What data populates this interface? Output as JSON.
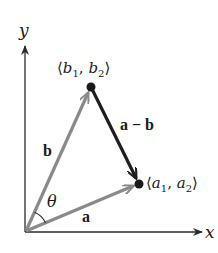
{
  "axes": {
    "x_label": "x",
    "y_label": "y"
  },
  "points": {
    "b": {
      "label_open": "⟨",
      "v1": "b",
      "s1": "1",
      "sep": ", ",
      "v2": "b",
      "s2": "2",
      "label_close": "⟩"
    },
    "a": {
      "label_open": "⟨",
      "v1": "a",
      "s1": "1",
      "sep": ", ",
      "v2": "a",
      "s2": "2",
      "label_close": "⟩"
    }
  },
  "vectors": {
    "a": {
      "label": "a",
      "color": "#8a8a8a"
    },
    "b": {
      "label": "b",
      "color": "#8a8a8a"
    },
    "a_minus_b": {
      "label": "a − b",
      "color": "#1e1e1e"
    }
  },
  "angle": {
    "label": "θ"
  },
  "colors": {
    "axis": "#2a2a2a",
    "vector_gray": "#8a8a8a",
    "difference": "#1e1e1e",
    "point": "#1a1a1a"
  }
}
